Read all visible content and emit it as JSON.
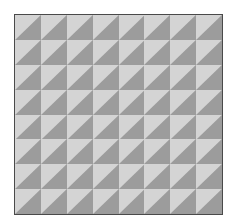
{
  "pattern": {
    "rows": 8,
    "columns": 8,
    "cell_shape": "half-square triangle, diagonal bottom-left to top-right",
    "colors": {
      "light": "#d4d4d4",
      "dark": "#9c9c9c",
      "border": "#4a4a4a",
      "background": "#ffffff"
    }
  }
}
